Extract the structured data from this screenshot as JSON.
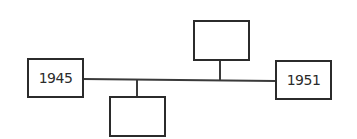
{
  "diagram": {
    "type": "timeline",
    "line_color": "#3a3a3a",
    "boxes": [
      {
        "id": "start",
        "label": "1945",
        "position": "left-end"
      },
      {
        "id": "event-below",
        "label": "",
        "position": "below-line"
      },
      {
        "id": "event-above",
        "label": "",
        "position": "above-line"
      },
      {
        "id": "end",
        "label": "1951",
        "position": "right-end"
      }
    ]
  }
}
